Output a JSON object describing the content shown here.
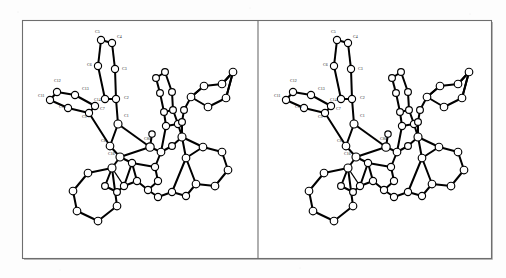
{
  "figure": {
    "kind": "ortep-stereo-pair",
    "background_color": "#fdfdfd",
    "line_color": "#000000",
    "frame_color": "#6e6e6e",
    "atom_fill": "#ffffff",
    "panel_count": 2,
    "caption": ""
  },
  "frame": {
    "left": 22,
    "top": 20,
    "right": 491,
    "bottom": 258,
    "divider_x": 258
  },
  "labels": {
    "list": [
      "C1",
      "C2",
      "C3",
      "C4",
      "C5",
      "C6",
      "C7",
      "C8",
      "C9",
      "C10",
      "C11",
      "C12",
      "C13",
      "C14",
      "C16",
      "C80"
    ],
    "annotated": [
      {
        "text": "C5",
        "x": 95,
        "y": 33
      },
      {
        "text": "C4",
        "x": 117,
        "y": 38
      },
      {
        "text": "C6",
        "x": 87,
        "y": 66
      },
      {
        "text": "C3",
        "x": 122,
        "y": 70
      },
      {
        "text": "C12",
        "x": 54,
        "y": 82
      },
      {
        "text": "C13",
        "x": 82,
        "y": 90
      },
      {
        "text": "C11",
        "x": 38,
        "y": 97
      },
      {
        "text": "C14",
        "x": 94,
        "y": 101
      },
      {
        "text": "C2",
        "x": 124,
        "y": 99
      },
      {
        "text": "C7",
        "x": 100,
        "y": 110
      },
      {
        "text": "C10",
        "x": 59,
        "y": 108
      },
      {
        "text": "C9",
        "x": 82,
        "y": 118
      },
      {
        "text": "C1",
        "x": 124,
        "y": 117
      },
      {
        "text": "C8",
        "x": 101,
        "y": 142
      },
      {
        "text": "C80",
        "x": 144,
        "y": 140
      },
      {
        "text": "C16",
        "x": 108,
        "y": 155
      }
    ]
  },
  "chart_data": {
    "type": "scatter",
    "xlabel": "",
    "ylabel": "",
    "panel_offsets": [
      0,
      236
    ],
    "atoms": [
      {
        "id": "C5",
        "x": 101,
        "y": 40,
        "r": 3.6,
        "label": "C5"
      },
      {
        "id": "C4",
        "x": 112,
        "y": 43,
        "r": 3.6,
        "label": "C4"
      },
      {
        "id": "C6",
        "x": 98,
        "y": 66,
        "r": 3.6,
        "label": "C6"
      },
      {
        "id": "C3",
        "x": 115,
        "y": 69,
        "r": 3.6,
        "label": "C3"
      },
      {
        "id": "C7",
        "x": 105,
        "y": 99,
        "r": 3.6,
        "label": "C7"
      },
      {
        "id": "C2",
        "x": 116,
        "y": 99,
        "r": 3.6,
        "label": "C2"
      },
      {
        "id": "C12",
        "x": 57,
        "y": 92,
        "r": 3.6,
        "label": "C12"
      },
      {
        "id": "C13",
        "x": 75,
        "y": 95,
        "r": 3.6,
        "label": "C13"
      },
      {
        "id": "C11",
        "x": 50,
        "y": 100,
        "r": 3.6,
        "label": "C11"
      },
      {
        "id": "C14",
        "x": 95,
        "y": 106,
        "r": 3.6,
        "label": "C14"
      },
      {
        "id": "C10",
        "x": 68,
        "y": 108,
        "r": 3.6,
        "label": "C10"
      },
      {
        "id": "C9",
        "x": 89,
        "y": 113,
        "r": 3.6,
        "label": "C9"
      },
      {
        "id": "C1",
        "x": 118,
        "y": 124,
        "r": 4.0,
        "label": "C1"
      },
      {
        "id": "C8",
        "x": 110,
        "y": 146,
        "r": 3.8,
        "label": "C8"
      },
      {
        "id": "C80",
        "x": 150,
        "y": 147,
        "r": 4.2,
        "label": "C80"
      },
      {
        "id": "C16",
        "x": 120,
        "y": 157,
        "r": 4.0,
        "label": "C16"
      }
    ],
    "ring_count": 8,
    "note": "Bond network reproduced geometrically; atom circles are open (white fill, black outline)."
  }
}
